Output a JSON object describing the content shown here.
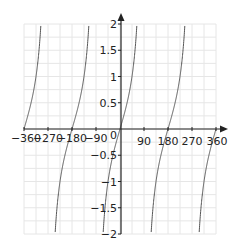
{
  "chart_data": {
    "type": "line",
    "title": "",
    "function": "y = tan(x)",
    "xlabel": "",
    "ylabel": "",
    "xlim": [
      -360,
      360
    ],
    "ylim": [
      -2,
      2
    ],
    "grid": true,
    "x_ticks": [
      -360,
      -270,
      -180,
      -90,
      0,
      90,
      180,
      270,
      360
    ],
    "x_tick_labels": [
      "−360",
      "−270",
      "−180",
      "−90",
      "0",
      "90",
      "180",
      "270",
      "360"
    ],
    "y_ticks": [
      2,
      1.5,
      1,
      0.5,
      -0.5,
      -1,
      -1.5,
      -2
    ],
    "y_tick_labels": [
      "2",
      "1.5",
      "1",
      "0.5",
      "−0.5",
      "−1",
      "−1.5",
      "−2"
    ],
    "asymptotes_x": [
      -270,
      -90,
      90,
      270
    ],
    "zeros_x": [
      -360,
      -180,
      0,
      180,
      360
    ],
    "series": [
      {
        "name": "tan(x)",
        "color": "#555555"
      }
    ]
  },
  "colors": {
    "axis": "#222222",
    "grid": "#e6e6e6",
    "curve": "#555555"
  }
}
